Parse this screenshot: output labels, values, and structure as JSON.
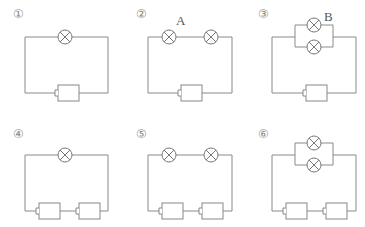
{
  "panels": [
    {
      "id": "1",
      "number_label": "①",
      "lamps": 1,
      "lamp_config": "single",
      "batteries": 1,
      "lamp_labels": [],
      "battery_labels": []
    },
    {
      "id": "2",
      "number_label": "②",
      "lamps": 2,
      "lamp_config": "series",
      "batteries": 1,
      "lamp_labels": [
        "A"
      ],
      "battery_labels": []
    },
    {
      "id": "3",
      "number_label": "③",
      "lamps": 2,
      "lamp_config": "parallel",
      "batteries": 1,
      "lamp_labels": [
        "B"
      ],
      "battery_labels": []
    },
    {
      "id": "4",
      "number_label": "④",
      "lamps": 1,
      "lamp_config": "single",
      "batteries": 2,
      "lamp_labels": [],
      "battery_labels": [
        "C"
      ]
    },
    {
      "id": "5",
      "number_label": "⑤",
      "lamps": 2,
      "lamp_config": "series",
      "batteries": 2,
      "lamp_labels": [],
      "battery_labels": []
    },
    {
      "id": "6",
      "number_label": "⑥",
      "lamps": 2,
      "lamp_config": "parallel",
      "batteries": 2,
      "lamp_labels": [],
      "battery_labels": []
    }
  ],
  "labels": {
    "lamp_a": "A",
    "lamp_b": "B",
    "battery_c": "C"
  },
  "colors": {
    "wire": "#8a8a8a",
    "text": "#555555"
  }
}
